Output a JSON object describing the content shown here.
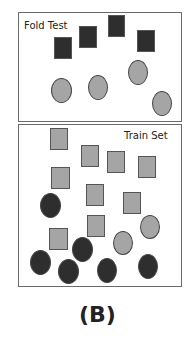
{
  "colors": {
    "dark": "#2e2e2e",
    "gray": "#a5a5a5",
    "border": "#6a6a6a"
  },
  "fold_test": {
    "label": "Fold Test",
    "box": {
      "x": 18,
      "y": 12,
      "w": 164,
      "h": 110
    },
    "squares": [
      {
        "x": 54,
        "y": 37,
        "w": 18,
        "h": 22,
        "fill": "dark"
      },
      {
        "x": 79,
        "y": 26,
        "w": 18,
        "h": 22,
        "fill": "dark"
      },
      {
        "x": 108,
        "y": 15,
        "w": 17,
        "h": 22,
        "fill": "dark"
      },
      {
        "x": 137,
        "y": 30,
        "w": 18,
        "h": 22,
        "fill": "dark"
      }
    ],
    "circles": [
      {
        "x": 51,
        "y": 78,
        "w": 21,
        "h": 25,
        "fill": "gray"
      },
      {
        "x": 88,
        "y": 75,
        "w": 20,
        "h": 25,
        "fill": "gray"
      },
      {
        "x": 128,
        "y": 60,
        "w": 20,
        "h": 25,
        "fill": "gray"
      },
      {
        "x": 152,
        "y": 91,
        "w": 20,
        "h": 25,
        "fill": "gray"
      }
    ]
  },
  "train_set": {
    "label": "Train Set",
    "box": {
      "x": 18,
      "y": 124,
      "w": 164,
      "h": 163
    },
    "squares": [
      {
        "x": 50,
        "y": 128,
        "w": 18,
        "h": 22,
        "fill": "gray"
      },
      {
        "x": 81,
        "y": 145,
        "w": 18,
        "h": 22,
        "fill": "gray"
      },
      {
        "x": 107,
        "y": 151,
        "w": 18,
        "h": 22,
        "fill": "gray"
      },
      {
        "x": 138,
        "y": 156,
        "w": 18,
        "h": 22,
        "fill": "gray"
      },
      {
        "x": 51,
        "y": 167,
        "w": 19,
        "h": 22,
        "fill": "gray"
      },
      {
        "x": 86,
        "y": 184,
        "w": 18,
        "h": 22,
        "fill": "gray"
      },
      {
        "x": 123,
        "y": 192,
        "w": 18,
        "h": 22,
        "fill": "gray"
      },
      {
        "x": 87,
        "y": 215,
        "w": 18,
        "h": 22,
        "fill": "gray"
      },
      {
        "x": 49,
        "y": 228,
        "w": 19,
        "h": 22,
        "fill": "gray"
      }
    ],
    "circles": [
      {
        "x": 40,
        "y": 193,
        "w": 21,
        "h": 25,
        "fill": "dark"
      },
      {
        "x": 140,
        "y": 215,
        "w": 20,
        "h": 24,
        "fill": "gray"
      },
      {
        "x": 113,
        "y": 231,
        "w": 20,
        "h": 24,
        "fill": "gray"
      },
      {
        "x": 72,
        "y": 237,
        "w": 21,
        "h": 25,
        "fill": "dark"
      },
      {
        "x": 30,
        "y": 250,
        "w": 21,
        "h": 25,
        "fill": "dark"
      },
      {
        "x": 58,
        "y": 259,
        "w": 21,
        "h": 25,
        "fill": "dark"
      },
      {
        "x": 97,
        "y": 258,
        "w": 20,
        "h": 25,
        "fill": "dark"
      },
      {
        "x": 138,
        "y": 254,
        "w": 20,
        "h": 25,
        "fill": "dark"
      }
    ]
  },
  "caption": "(B)"
}
